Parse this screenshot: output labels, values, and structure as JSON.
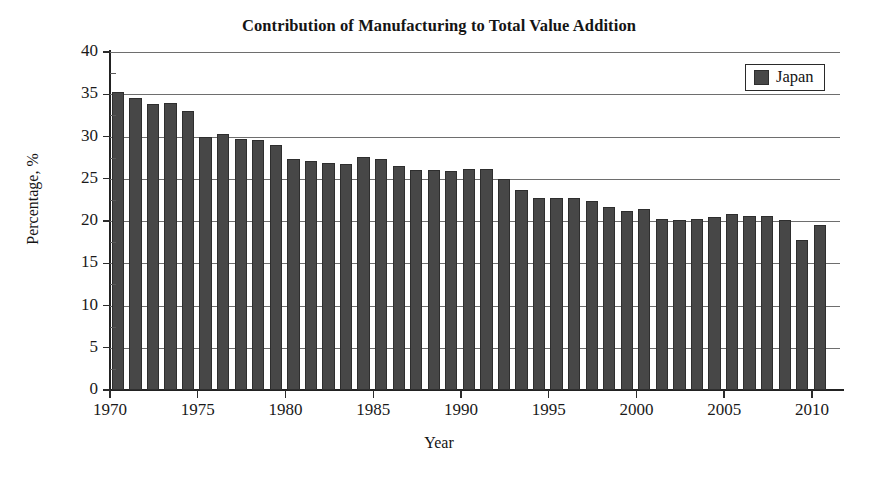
{
  "chart_data": {
    "type": "bar",
    "title": "Contribution of Manufacturing to Total Value Addition",
    "xlabel": "Year",
    "ylabel": "Percentage, %",
    "ylim": [
      0,
      40
    ],
    "ytick_values": [
      0,
      5,
      10,
      15,
      20,
      25,
      30,
      35,
      40
    ],
    "ytick_labels": [
      "0",
      "5",
      "10",
      "15",
      "20",
      "25",
      "30",
      "35",
      "40"
    ],
    "xlim": [
      1969.5,
      2011
    ],
    "xtick_values": [
      1970,
      1975,
      1980,
      1985,
      1990,
      1995,
      2000,
      2005,
      2010
    ],
    "xtick_labels": [
      "1970",
      "1975",
      "1980",
      "1985",
      "1990",
      "1995",
      "2000",
      "2005",
      "2010"
    ],
    "grid": "horizontal",
    "legend_position": "top-right",
    "legend": [
      "Japan"
    ],
    "bar_color": "#474747",
    "categories": [
      1970,
      1971,
      1972,
      1973,
      1974,
      1975,
      1976,
      1977,
      1978,
      1979,
      1980,
      1981,
      1982,
      1983,
      1984,
      1985,
      1986,
      1987,
      1988,
      1989,
      1990,
      1991,
      1992,
      1993,
      1994,
      1995,
      1996,
      1997,
      1998,
      1999,
      2000,
      2001,
      2002,
      2003,
      2004,
      2005,
      2006,
      2007,
      2008,
      2009,
      2010
    ],
    "series": [
      {
        "name": "Japan",
        "values": [
          35.3,
          34.6,
          33.8,
          34.0,
          33.0,
          30.0,
          30.3,
          29.7,
          29.6,
          29.0,
          27.3,
          27.1,
          26.9,
          26.8,
          27.6,
          27.3,
          26.5,
          26.0,
          26.0,
          25.9,
          26.1,
          26.1,
          25.0,
          23.7,
          22.7,
          22.7,
          22.7,
          22.4,
          21.7,
          21.2,
          21.4,
          20.2,
          20.1,
          20.2,
          20.5,
          20.8,
          20.6,
          20.6,
          20.1,
          17.7,
          19.5
        ]
      }
    ]
  },
  "legend": {
    "swatch_name": "japan-swatch",
    "label": "Japan"
  }
}
